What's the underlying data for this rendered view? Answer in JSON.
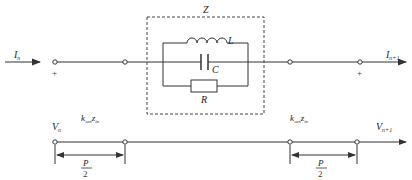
{
  "diagram": {
    "type": "circuit",
    "impedance_block": {
      "label": "Z",
      "components": [
        {
          "name": "inductor",
          "label": "L"
        },
        {
          "name": "capacitor",
          "label": "C"
        },
        {
          "name": "resistor",
          "label": "R"
        }
      ]
    },
    "currents": {
      "input": {
        "symbol": "I",
        "subscript": "n"
      },
      "output": {
        "symbol": "I",
        "subscript": "n+1"
      }
    },
    "polarity": {
      "left": "+",
      "right": "+"
    },
    "line_sections": {
      "left": {
        "symbol": "k",
        "k_sub": "sen",
        "z": "z",
        "z_sub": "in"
      },
      "right": {
        "symbol": "k",
        "k_sub": "sen",
        "z": "z",
        "z_sub": "in"
      }
    },
    "voltages": {
      "input": {
        "symbol": "V",
        "subscript": "n"
      },
      "output": {
        "symbol": "V",
        "subscript": "n+1"
      }
    },
    "dimensions": {
      "left": {
        "numerator": "P",
        "denominator": "2"
      },
      "right": {
        "numerator": "P",
        "denominator": "2"
      }
    },
    "colors": {
      "line": "#333333",
      "dashed": "#444444"
    }
  }
}
